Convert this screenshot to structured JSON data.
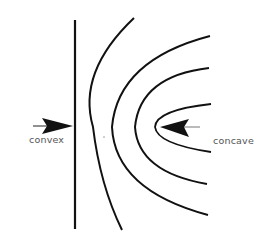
{
  "labels": {
    "convex": "convex",
    "concave": "concave"
  },
  "colors": {
    "stroke": "#111111",
    "text": "#555555",
    "background": "#ffffff"
  },
  "elements": {
    "flat_wall": {
      "x": 75,
      "y1": 20,
      "y2": 229
    },
    "curves": [
      {
        "name": "outer",
        "start": [
          134,
          18
        ],
        "apex": [
          93,
          127
        ],
        "end": [
          122,
          230
        ]
      },
      {
        "name": "second",
        "start": [
          210,
          36
        ],
        "apex": [
          112,
          127
        ],
        "end": [
          208,
          215
        ]
      },
      {
        "name": "third",
        "start": [
          209,
          68
        ],
        "apex": [
          135,
          127
        ],
        "end": [
          207,
          184
        ]
      },
      {
        "name": "inner",
        "start": [
          211,
          104
        ],
        "apex": [
          155,
          127
        ],
        "end": [
          211,
          152
        ]
      }
    ],
    "convex_arrow": {
      "direction": "right",
      "tip": [
        73,
        126
      ]
    },
    "concave_arrow": {
      "direction": "left",
      "tip": [
        160,
        127
      ]
    }
  }
}
